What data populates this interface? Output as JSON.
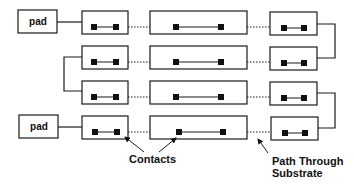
{
  "diagram": {
    "pads": [
      {
        "label": "pad",
        "position": "top"
      },
      {
        "label": "pad",
        "position": "bottom"
      }
    ],
    "rows": 4,
    "columns": [
      "left-segment",
      "middle-segment",
      "right-segment"
    ],
    "connections": {
      "left_bracket": "rows 2-3",
      "right_brackets": [
        "rows 1-2",
        "rows 3-4"
      ],
      "substrate_paths": "dotted lines between adjacent segments in each row"
    },
    "annotations": {
      "contacts": "Contacts",
      "path_line1": "Path Through",
      "path_line2": "Substrate"
    },
    "colors": {
      "stroke": "#1a1a1a",
      "contact_fill": "#111111",
      "background": "#ffffff"
    }
  }
}
